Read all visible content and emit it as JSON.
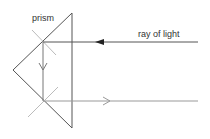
{
  "diagram": {
    "labels": {
      "prism": "prism",
      "ray": "ray of light"
    },
    "colors": {
      "prism_edge": "#555555",
      "ray": "#555555",
      "ray_return": "#888888",
      "normal": "#bbbbbb",
      "text": "#333333"
    },
    "elements": [
      {
        "name": "prism",
        "shape": "triangle"
      },
      {
        "name": "incoming-ray",
        "direction": "left",
        "arrow": "filled"
      },
      {
        "name": "reflected-ray-vertical",
        "direction": "down",
        "arrow": "open"
      },
      {
        "name": "outgoing-ray",
        "direction": "right",
        "arrow": "open"
      },
      {
        "name": "normal-top",
        "shape": "cross"
      },
      {
        "name": "normal-bottom",
        "shape": "cross"
      }
    ]
  }
}
